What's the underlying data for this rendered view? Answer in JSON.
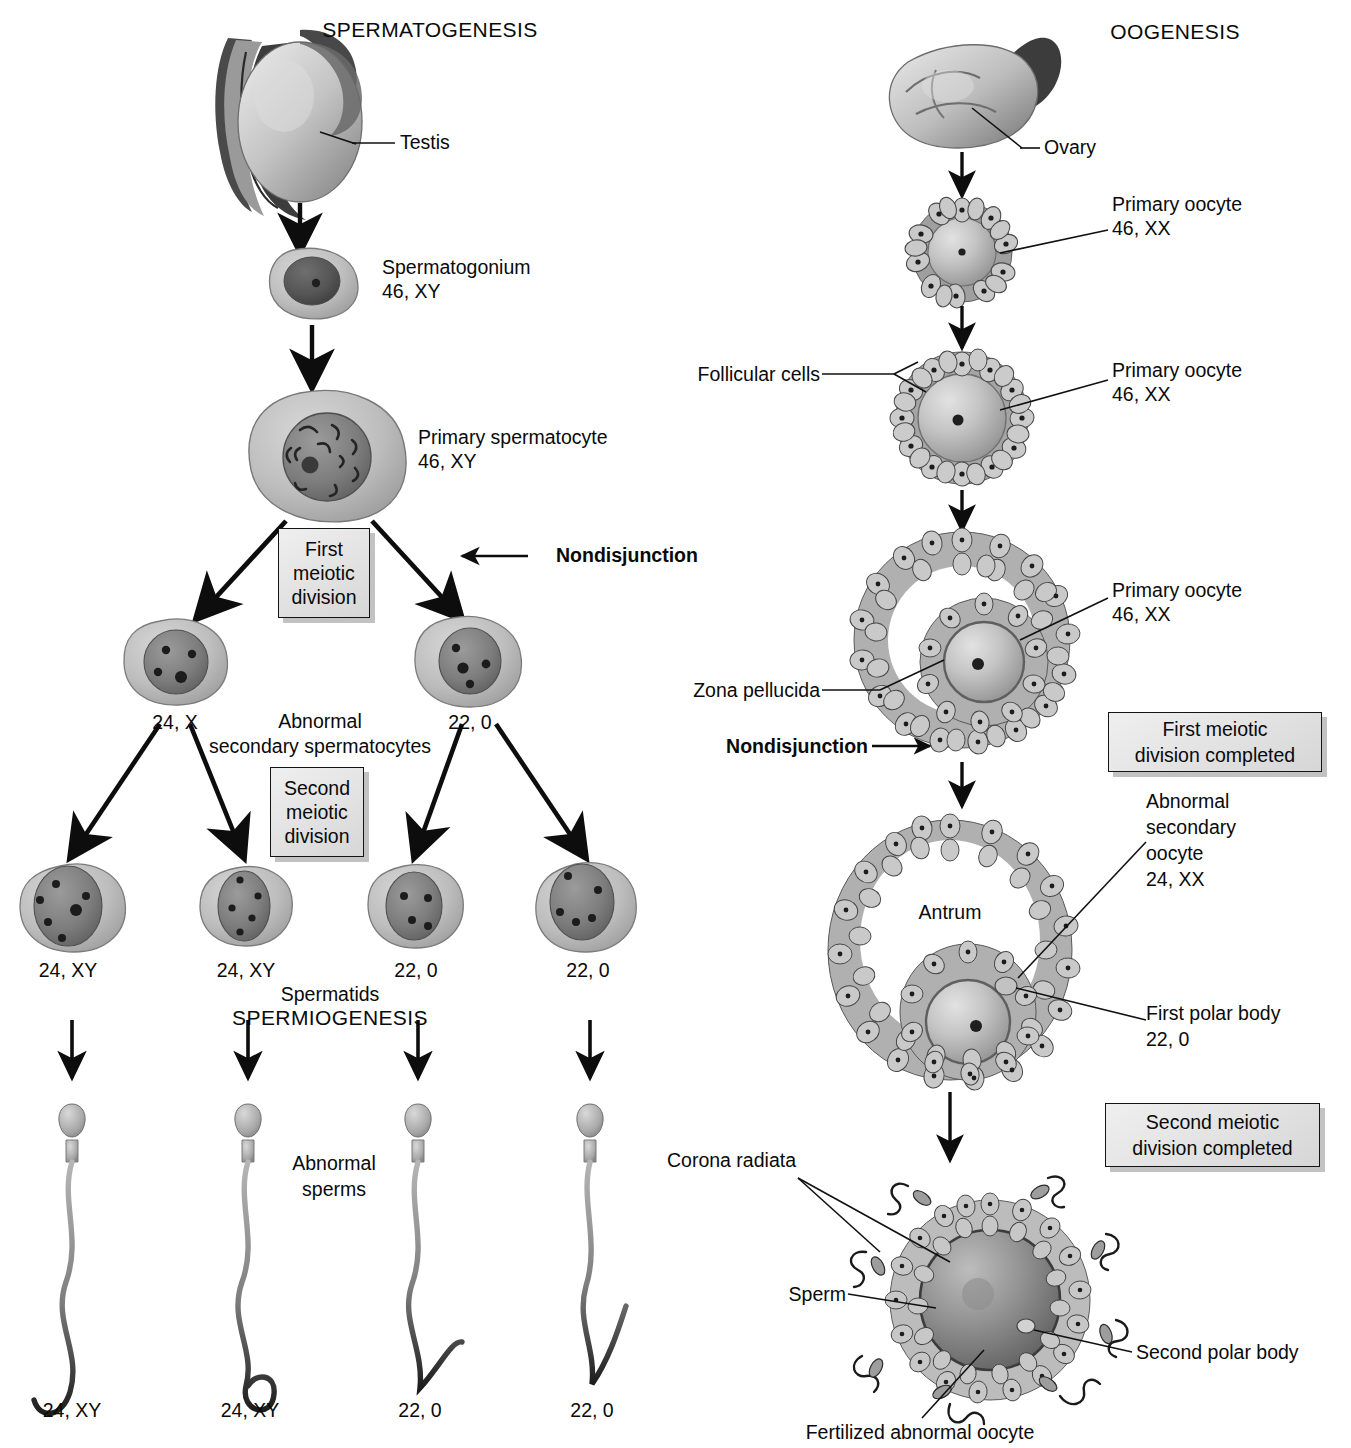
{
  "figure": {
    "type": "biology-diagram",
    "background": "#ffffff",
    "ink": "#0a0a0a",
    "box_fill": "#e6e6e6"
  },
  "left_column": {
    "title": "SPERMATOGENESIS",
    "organ_label": "Testis",
    "stages": [
      {
        "name": "Spermatogonium",
        "karyotype": "46, XY"
      },
      {
        "name": "Primary spermatocyte",
        "karyotype": "46, XY"
      }
    ],
    "division_box_1": "First\nmeiotic\ndivision",
    "division_box_2": "Second\nmeiotic\ndivision",
    "nondisjunction_label": "Nondisjunction",
    "secondary_group_label": "Abnormal\nsecondary spermatocytes",
    "secondary_cells": [
      {
        "karyotype": "24, X"
      },
      {
        "karyotype": "22, 0"
      }
    ],
    "spermatid_group_label": "Spermatids",
    "spermiogenesis_label": "SPERMIOGENESIS",
    "spermatids": [
      {
        "karyotype": "24, XY"
      },
      {
        "karyotype": "24, XY"
      },
      {
        "karyotype": "22, 0"
      },
      {
        "karyotype": "22, 0"
      }
    ],
    "sperm_group_label": "Abnormal\nsperms",
    "sperms": [
      {
        "karyotype": "24, XY"
      },
      {
        "karyotype": "24, XY"
      },
      {
        "karyotype": "22, 0"
      },
      {
        "karyotype": "22, 0"
      }
    ]
  },
  "right_column": {
    "title": "OOGENESIS",
    "organ_label": "Ovary",
    "stages": [
      {
        "name": "Primary oocyte",
        "karyotype": "46, XX"
      },
      {
        "name": "Primary oocyte",
        "karyotype": "46, XX"
      },
      {
        "name": "Primary oocyte",
        "karyotype": "46, XX"
      }
    ],
    "follicular_cells_label": "Follicular cells",
    "zona_pellucida_label": "Zona pellucida",
    "nondisjunction_label": "Nondisjunction",
    "division_box_1": "First meiotic\ndivision completed",
    "division_box_2": "Second meiotic\ndivision completed",
    "antrum_label": "Antrum",
    "secondary_oocyte_label": "Abnormal\nsecondary\noocyte\n24, XX",
    "first_polar_body_label": "First polar body\n22, 0",
    "corona_radiata_label": "Corona radiata",
    "sperm_label": "Sperm",
    "second_polar_body_label": "Second polar body",
    "fertilized_oocyte_label": "Fertilized abnormal oocyte"
  },
  "caption": {
    "text": "clipped-caption-line"
  }
}
